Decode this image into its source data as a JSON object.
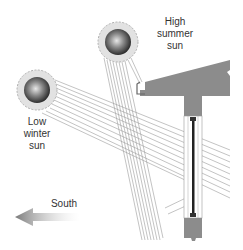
{
  "diagram": {
    "labels": {
      "high_sun": [
        "High",
        "summer",
        "sun"
      ],
      "low_sun": [
        "Low",
        "winter",
        "sun"
      ],
      "direction": "South"
    },
    "colors": {
      "structure": "#8c8c8c",
      "rays": "#9a9a9a",
      "sun_halo": "#e0e0e0",
      "sun_core_dark": "#2a2a2a",
      "sun_core_light": "#d8d8d8",
      "glass": "#222222",
      "arrow": "#8a8a8a"
    },
    "elements": {
      "high_sun": {
        "cx": 118,
        "cy": 42,
        "r": 20
      },
      "low_sun": {
        "cx": 37,
        "cy": 90,
        "r": 20
      }
    }
  }
}
